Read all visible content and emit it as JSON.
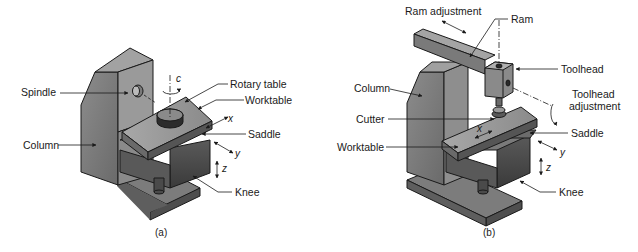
{
  "figure_a": {
    "caption": "(a)",
    "labels": {
      "spindle": "Spindle",
      "column": "Column",
      "rotary_table": "Rotary table",
      "worktable": "Worktable",
      "saddle": "Saddle",
      "knee": "Knee"
    },
    "axes": {
      "c": "c",
      "x": "x",
      "y": "y",
      "z": "z"
    }
  },
  "figure_b": {
    "caption": "(b)",
    "labels": {
      "ram_adjustment": "Ram adjustment",
      "ram": "Ram",
      "toolhead": "Toolhead",
      "toolhead_adjustment_1": "Toolhead",
      "toolhead_adjustment_2": "adjustment",
      "column": "Column",
      "cutter": "Cutter",
      "worktable": "Worktable",
      "saddle": "Saddle",
      "knee": "Knee"
    },
    "axes": {
      "x": "x",
      "y": "y",
      "z": "z"
    }
  },
  "colors": {
    "face_light": "#9a9a9a",
    "face_mid": "#6e6e6e",
    "face_dark": "#4a4a4a",
    "outline": "#1a1a1a"
  }
}
